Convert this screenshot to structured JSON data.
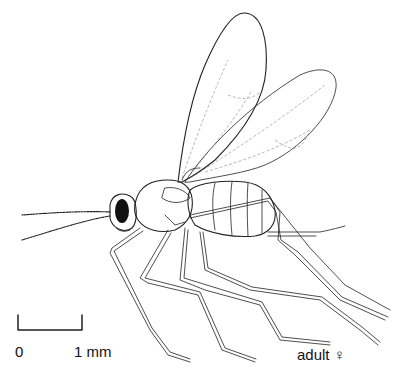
{
  "figure": {
    "scale_bar": {
      "start_label": "0",
      "end_label": "1 mm"
    },
    "caption": "adult ♀"
  },
  "colors": {
    "ink": "#222222",
    "background": "#ffffff",
    "eye": "#111111"
  }
}
